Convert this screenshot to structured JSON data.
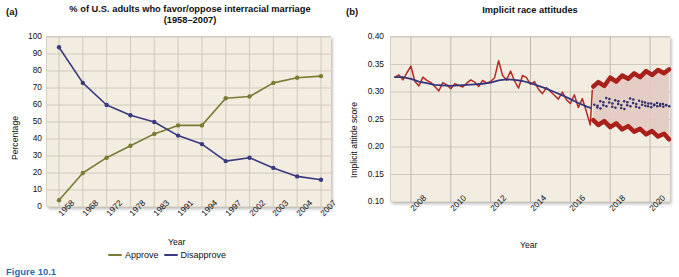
{
  "figure": {
    "caption": "Figure 10.1",
    "caption_color": "#1f6fb4"
  },
  "panel_a": {
    "letter": "(a)",
    "title": "% of U.S. adults who favor/oppose interracial marriage (1958–2007)",
    "xlabel": "Year",
    "ylabel": "Percentage",
    "legend": [
      {
        "label": "Approve",
        "color": "#7a7a33"
      },
      {
        "label": "Disapprove",
        "color": "#3a3a80"
      }
    ]
  },
  "panel_b": {
    "letter": "(b)",
    "title": "Implicit race attitudes",
    "xlabel": "Year",
    "ylabel": "Implicit attitde score",
    "colors": {
      "observed": "#b52a22",
      "trend": "#35357f",
      "band_outer": "#a82019",
      "band_inner": "#e2cbc2",
      "forecast_points": "#2f2f6e"
    }
  },
  "chart_data": [
    {
      "type": "line",
      "panel": "a",
      "title": "% of U.S. adults who favor/oppose interracial marriage (1958–2007)",
      "xlabel": "Year",
      "ylabel": "Percentage",
      "ylim": [
        0,
        100
      ],
      "yticks": [
        0,
        10,
        20,
        30,
        40,
        50,
        60,
        70,
        80,
        90,
        100
      ],
      "grid": true,
      "legend_position": "bottom",
      "categories": [
        "1958",
        "1968",
        "1972",
        "1978",
        "1983",
        "1991",
        "1994",
        "1997",
        "2002",
        "2003",
        "2004",
        "2007"
      ],
      "series": [
        {
          "name": "Approve",
          "color": "#7a7a33",
          "values": [
            4,
            20,
            29,
            36,
            43,
            48,
            48,
            64,
            65,
            73,
            76,
            77
          ]
        },
        {
          "name": "Disapprove",
          "color": "#3a3a80",
          "values": [
            94,
            73,
            60,
            54,
            50,
            42,
            37,
            27,
            29,
            23,
            18,
            16
          ]
        }
      ]
    },
    {
      "type": "line",
      "panel": "b",
      "title": "Implicit race attitudes",
      "xlabel": "Year",
      "ylabel": "Implicit attitde score",
      "ylim": [
        0.1,
        0.4
      ],
      "yticks": [
        0.1,
        0.15,
        0.2,
        0.25,
        0.3,
        0.35,
        0.4
      ],
      "xticks": [
        2008,
        2010,
        2012,
        2014,
        2016,
        2018,
        2020
      ],
      "xlim": [
        2007.0,
        2021.0
      ],
      "grid": true,
      "legend_position": "none",
      "series": [
        {
          "name": "Observed monthly score",
          "color": "#b52a22",
          "x": [
            2007.2,
            2007.4,
            2007.6,
            2007.8,
            2008.0,
            2008.2,
            2008.4,
            2008.6,
            2008.8,
            2009.0,
            2009.2,
            2009.4,
            2009.6,
            2009.8,
            2010.0,
            2010.2,
            2010.4,
            2010.6,
            2010.8,
            2011.0,
            2011.2,
            2011.4,
            2011.6,
            2011.8,
            2012.0,
            2012.2,
            2012.4,
            2012.6,
            2012.8,
            2013.0,
            2013.2,
            2013.4,
            2013.6,
            2013.8,
            2014.0,
            2014.2,
            2014.4,
            2014.6,
            2014.8,
            2015.0,
            2015.2,
            2015.4,
            2015.6,
            2015.8,
            2016.0,
            2016.2,
            2016.4,
            2016.6,
            2016.8,
            2017.0,
            2017.1
          ],
          "values": [
            0.327,
            0.331,
            0.322,
            0.335,
            0.347,
            0.319,
            0.311,
            0.327,
            0.321,
            0.317,
            0.31,
            0.302,
            0.317,
            0.313,
            0.306,
            0.315,
            0.312,
            0.309,
            0.316,
            0.322,
            0.318,
            0.31,
            0.321,
            0.316,
            0.319,
            0.326,
            0.357,
            0.33,
            0.322,
            0.338,
            0.32,
            0.307,
            0.33,
            0.326,
            0.314,
            0.319,
            0.305,
            0.297,
            0.308,
            0.301,
            0.294,
            0.287,
            0.3,
            0.286,
            0.279,
            0.295,
            0.272,
            0.288,
            0.265,
            0.24,
            0.303
          ]
        },
        {
          "name": "Smoothed trend",
          "color": "#35357f",
          "x": [
            2007.2,
            2007.6,
            2008.0,
            2008.4,
            2008.8,
            2009.2,
            2009.6,
            2010.0,
            2010.4,
            2010.8,
            2011.2,
            2011.6,
            2012.0,
            2012.4,
            2012.8,
            2013.2,
            2013.6,
            2014.0,
            2014.4,
            2014.8,
            2015.2,
            2015.6,
            2016.0,
            2016.4,
            2016.8,
            2017.0
          ],
          "values": [
            0.327,
            0.327,
            0.324,
            0.319,
            0.316,
            0.313,
            0.312,
            0.311,
            0.312,
            0.313,
            0.314,
            0.315,
            0.317,
            0.321,
            0.323,
            0.322,
            0.32,
            0.316,
            0.311,
            0.306,
            0.3,
            0.294,
            0.287,
            0.28,
            0.274,
            0.271
          ]
        },
        {
          "name": "Forecast median",
          "color": "#2f2f6e",
          "style": "dotted",
          "x": [
            2017.2,
            2017.35,
            2017.5,
            2017.65,
            2017.8,
            2017.95,
            2018.1,
            2018.25,
            2018.4,
            2018.55,
            2018.7,
            2018.85,
            2019.0,
            2019.15,
            2019.3,
            2019.45,
            2019.6,
            2019.75,
            2019.9,
            2020.05,
            2020.2,
            2020.35,
            2020.5,
            2020.65,
            2020.8
          ],
          "values": [
            0.277,
            0.272,
            0.283,
            0.276,
            0.289,
            0.281,
            0.273,
            0.285,
            0.278,
            0.271,
            0.283,
            0.276,
            0.288,
            0.28,
            0.273,
            0.284,
            0.277,
            0.281,
            0.274,
            0.279,
            0.276,
            0.28,
            0.275,
            0.278,
            0.276
          ]
        },
        {
          "name": "Forecast interval upper",
          "color": "#a82019",
          "x": [
            2017.15,
            2017.4,
            2017.7,
            2018.0,
            2018.3,
            2018.6,
            2018.9,
            2019.2,
            2019.5,
            2019.8,
            2020.1,
            2020.4,
            2020.7,
            2020.95
          ],
          "values": [
            0.31,
            0.318,
            0.311,
            0.326,
            0.319,
            0.33,
            0.324,
            0.334,
            0.327,
            0.338,
            0.331,
            0.34,
            0.334,
            0.341
          ]
        },
        {
          "name": "Forecast interval lower",
          "color": "#a82019",
          "x": [
            2017.15,
            2017.4,
            2017.7,
            2018.0,
            2018.3,
            2018.6,
            2018.9,
            2019.2,
            2019.5,
            2019.8,
            2020.1,
            2020.4,
            2020.7,
            2020.95
          ],
          "values": [
            0.249,
            0.24,
            0.247,
            0.236,
            0.243,
            0.232,
            0.238,
            0.228,
            0.233,
            0.223,
            0.229,
            0.219,
            0.224,
            0.214
          ]
        }
      ]
    }
  ]
}
